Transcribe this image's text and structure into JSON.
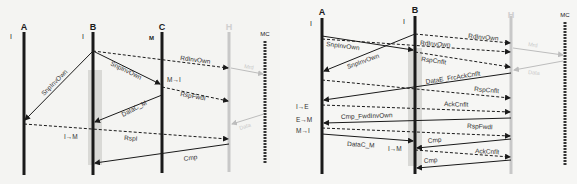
{
  "left_diagram": {
    "actors": [
      {
        "name": "A",
        "state": "I",
        "x": 24
      },
      {
        "name": "B",
        "state": "I",
        "x": 93
      },
      {
        "name": "C",
        "state": "M",
        "x": 162
      },
      {
        "name": "H",
        "state": "",
        "x": 229
      },
      {
        "name": "MC",
        "state": "",
        "x": 265
      }
    ],
    "messages": [
      {
        "label": "RdInvOwn",
        "from": "B",
        "to": "H",
        "style": "dashed"
      },
      {
        "label": "SnpInvOwn",
        "from": "B",
        "to": "A",
        "style": "solid"
      },
      {
        "label": "SnpInvOwn",
        "from": "B",
        "to": "C",
        "style": "solid"
      },
      {
        "label": "Mrd",
        "from": "H",
        "to": "MC",
        "style": "faded"
      },
      {
        "label": "RspFwdI",
        "from": "C",
        "to": "H",
        "style": "dashed"
      },
      {
        "label": "DataC_M",
        "from": "C",
        "to": "B",
        "style": "solid"
      },
      {
        "label": "Data",
        "from": "MC",
        "to": "H",
        "style": "faded"
      },
      {
        "label": "RspI",
        "from": "A",
        "to": "H",
        "style": "dashed"
      },
      {
        "label": "Cmp",
        "from": "H",
        "to": "B",
        "style": "solid"
      }
    ],
    "transitions": [
      {
        "label": "M→I",
        "actor": "C"
      },
      {
        "label": "I→M",
        "actor": "B"
      }
    ]
  },
  "right_diagram": {
    "actors": [
      {
        "name": "A",
        "state": "I",
        "x": 322
      },
      {
        "name": "B",
        "state": "I",
        "x": 415
      },
      {
        "name": "H",
        "state": "",
        "x": 511
      },
      {
        "name": "MC",
        "state": "",
        "x": 565
      }
    ],
    "messages": [
      {
        "label": "RdInvOwn",
        "from": "B",
        "to": "H",
        "style": "dashed"
      },
      {
        "label": "SnpInvOwn",
        "from": "A",
        "to": "B",
        "style": "solid"
      },
      {
        "label": "RdInvOwn",
        "from": "A",
        "to": "H",
        "style": "dashed"
      },
      {
        "label": "SnpInvOwn",
        "from": "B",
        "to": "A",
        "style": "solid"
      },
      {
        "label": "Mrd",
        "from": "H",
        "to": "MC",
        "style": "faded"
      },
      {
        "label": "RspCnflt",
        "from": "B",
        "to": "H",
        "style": "dashed"
      },
      {
        "label": "Data",
        "from": "MC",
        "to": "H",
        "style": "faded"
      },
      {
        "label": "DataE_FrcAckCnflt",
        "from": "H",
        "to": "A",
        "style": "solid"
      },
      {
        "label": "RspCnflt",
        "from": "A",
        "to": "H",
        "style": "dashed"
      },
      {
        "label": "AckCnflt",
        "from": "A",
        "to": "H",
        "style": "dashed"
      },
      {
        "label": "Cmp_FwdInvOwn",
        "from": "H",
        "to": "A",
        "style": "solid"
      },
      {
        "label": "RspFwdI",
        "from": "A",
        "to": "H",
        "style": "dashed"
      },
      {
        "label": "DataC_M",
        "from": "A",
        "to": "B",
        "style": "solid"
      },
      {
        "label": "Cmp",
        "from": "H",
        "to": "B",
        "style": "solid"
      },
      {
        "label": "AckCnflt",
        "from": "B",
        "to": "H",
        "style": "dashed"
      },
      {
        "label": "Cmp",
        "from": "H",
        "to": "B",
        "style": "solid"
      }
    ],
    "transitions": [
      {
        "label": "I→E",
        "actor": "A"
      },
      {
        "label": "E→M",
        "actor": "A"
      },
      {
        "label": "M→I",
        "actor": "A"
      },
      {
        "label": "I→M",
        "actor": "B"
      }
    ]
  },
  "colors": {
    "line": "#1a1a1a",
    "faded": "#bdbdbd",
    "highlight": "#d9d9d6"
  }
}
